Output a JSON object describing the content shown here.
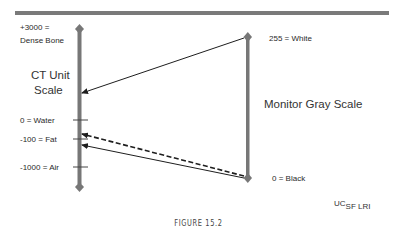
{
  "diagram": {
    "ct_scale": {
      "title_line1": "CT Unit",
      "title_line2": "Scale",
      "top_label_line1": "+3000 =",
      "top_label_line2": "Dense Bone",
      "ticks": [
        {
          "label": "0 = Water"
        },
        {
          "label": "-100 = Fat"
        },
        {
          "label": "-1000 = Air"
        }
      ]
    },
    "monitor_scale": {
      "title": "Monitor Gray Scale",
      "top_label": "255 = White",
      "bottom_label": "0 = Black"
    },
    "mappings": [
      {
        "from": "255 = White",
        "to": "CT window upper level",
        "style": "solid"
      },
      {
        "from": "0 = Black",
        "to": "CT window lower level (above fat)",
        "style": "dashed"
      },
      {
        "from": "0 = Black",
        "to": "CT window lower level (below fat)",
        "style": "solid"
      }
    ],
    "colors": {
      "axis": "#777777",
      "top_rule": "#7a7a7a",
      "arrow": "#1e1e1e"
    },
    "credit_main": "UC",
    "credit_sub": "SF LRI",
    "caption": "FIGURE 15.2"
  }
}
